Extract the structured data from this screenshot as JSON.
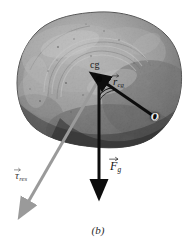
{
  "figure": {
    "caption": "(b)",
    "background_color": "#ffffff",
    "width": 196,
    "height": 246
  },
  "body_object": {
    "name": "rock",
    "description": "irregular textured grayscale boulder",
    "fill_color": "#8c8c8c",
    "outline_color": "#4a4a4a",
    "bounds": {
      "x": 17,
      "y": 12,
      "width": 166,
      "height": 136
    }
  },
  "points": [
    {
      "id": "cg",
      "label": "cg",
      "label_x": 90,
      "label_y": 60,
      "x": 99,
      "y": 79,
      "marker_color": "#000000"
    },
    {
      "id": "pivot",
      "label": "O",
      "label_x": 151,
      "label_y": 112,
      "x": 155,
      "y": 117,
      "marker_color": "#ffffff"
    }
  ],
  "vectors": [
    {
      "id": "r-cg",
      "symbol": "r",
      "subscript": "cg",
      "label_plain": "r_cg",
      "color": "#101010",
      "from": {
        "x": 99,
        "y": 79
      },
      "to": {
        "x": 152,
        "y": 115
      },
      "label_x": 113,
      "label_y": 76,
      "description": "position vector from pivot O to center of gravity"
    },
    {
      "id": "f-g",
      "symbol": "F",
      "subscript": "g",
      "label_plain": "F_g",
      "color": "#101010",
      "from": {
        "x": 99,
        "y": 79
      },
      "to": {
        "x": 99,
        "y": 192
      },
      "label_x": 110,
      "label_y": 160,
      "description": "gravitational force acting at the center of gravity"
    },
    {
      "id": "tau-res",
      "symbol": "τ",
      "subscript": "res",
      "label_plain": "tau_res",
      "color": "#9a9a9a",
      "from": {
        "x": 99,
        "y": 79
      },
      "to": {
        "x": 23,
        "y": 211
      },
      "label_x": 15,
      "label_y": 170,
      "description": "resultant torque vector"
    }
  ],
  "angle_arc": {
    "id": "angle-at-cg",
    "between": [
      "f-g",
      "r-cg"
    ],
    "vertex": {
      "x": 99,
      "y": 79
    },
    "color": "#141414",
    "radius": 17
  }
}
